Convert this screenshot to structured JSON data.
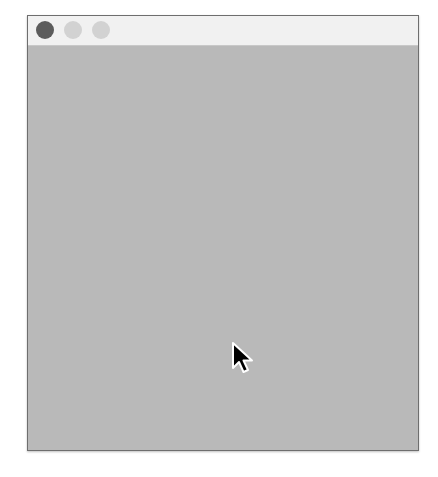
{
  "window": {
    "title": "",
    "titlebar_color": "#f1f1f1",
    "content_color": "#b9b9b9",
    "traffic_lights": [
      {
        "name": "close",
        "color": "#5c5c5c"
      },
      {
        "name": "minimize",
        "color": "#d2d2d2"
      },
      {
        "name": "zoom",
        "color": "#d2d2d2"
      }
    ]
  },
  "content": {
    "text": ""
  },
  "cursor": {
    "icon": "arrow-pointer-icon",
    "x": 233,
    "y": 343
  }
}
